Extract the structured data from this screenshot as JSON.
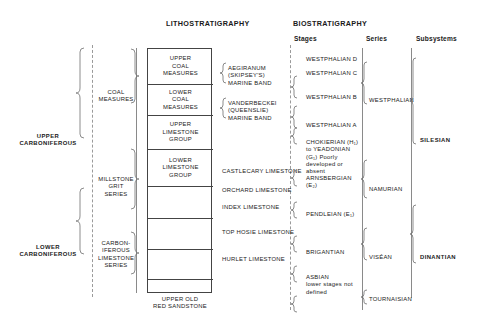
{
  "headers": {
    "lithostratigraphy": "LITHOSTRATIGRAPHY",
    "biostratigraphy": "BIOSTRATIGRAPHY",
    "stages": "Stages",
    "series": "Series",
    "subsystems": "Subsystems"
  },
  "system_divisions": [
    {
      "label_line1": "UPPER",
      "label_line2": "CARBONIFEROUS"
    },
    {
      "label_line1": "LOWER",
      "label_line2": "CARBONIFEROUS"
    }
  ],
  "lithostratigraphy": {
    "groupings": [
      {
        "lines": [
          "COAL",
          "MEASURES"
        ]
      },
      {
        "lines": [
          "MILLSTONE",
          "GRIT",
          "SERIES"
        ]
      },
      {
        "lines": [
          "CARBON-",
          "IFEROUS",
          "LIMESTONE",
          "SERIES"
        ]
      }
    ],
    "units": [
      {
        "lines": [
          "UPPER",
          "COAL",
          "MEASURES"
        ]
      },
      {
        "lines": [
          "MIDDLE",
          "COAL",
          "MEASURES"
        ]
      },
      {
        "lines": [
          "LOWER",
          "COAL",
          "MEASURES"
        ]
      },
      {
        "lines": [
          "PASSAGE",
          "GROUP"
        ]
      },
      {
        "lines": [
          "UPPER",
          "LIMESTONE",
          "GROUP"
        ]
      },
      {
        "lines": [
          "LIMESTONE",
          "COAL",
          "GROUP"
        ]
      },
      {
        "lines": [
          "LOWER",
          "LIMESTONE",
          "GROUP"
        ]
      },
      {
        "lines": [
          "CALCIFEROUS",
          "SANDSTONE",
          "MEASURES"
        ]
      }
    ],
    "basement": {
      "lines": [
        "UPPER OLD",
        "RED SANDSTONE"
      ]
    },
    "marker_bands": [
      {
        "lines": [
          "AEGIRANUM",
          "(SKIPSEY'S)",
          "MARINE BAND"
        ]
      },
      {
        "lines": [
          "VANDERBECKEI",
          "(QUEENSLIE)",
          "MARINE BAND"
        ]
      }
    ],
    "marker_limestones": [
      {
        "label": "CASTLECARY LIMESTONE"
      },
      {
        "label": "ORCHARD LIMESTONE"
      },
      {
        "label": "INDEX LIMESTONE"
      },
      {
        "label": "TOP HOSIE LIMESTONE"
      },
      {
        "label": "HURLET LIMESTONE"
      }
    ]
  },
  "biostratigraphy": {
    "stages": [
      {
        "lines": [
          "WESTPHALIAN D"
        ]
      },
      {
        "lines": [
          "WESTPHALIAN C"
        ]
      },
      {
        "lines": [
          "WESTPHALIAN B"
        ]
      },
      {
        "lines": [
          "WESTPHALIAN A"
        ]
      },
      {
        "lines": [
          "CHOKIERIAN (H₁)",
          "to  YEADONIAN",
          "(G₁) Poorly",
          "developed  or",
          "absent"
        ]
      },
      {
        "lines": [
          "ARNSBERGIAN",
          "(E₂)"
        ]
      },
      {
        "lines": [
          "PENDLEIAN (E₁)"
        ]
      },
      {
        "lines": [
          "BRIGANTIAN"
        ]
      },
      {
        "lines": [
          "ASBIAN",
          "lower stages not",
          "defined"
        ]
      }
    ],
    "series": [
      {
        "label": "WESTPHALIAN"
      },
      {
        "label": "NAMURIAN"
      },
      {
        "label": "VISÉAN"
      },
      {
        "label": "TOURNAISIAN"
      }
    ],
    "subsystems": [
      {
        "label": "SILESIAN"
      },
      {
        "label": "DINANTIAN"
      }
    ]
  }
}
